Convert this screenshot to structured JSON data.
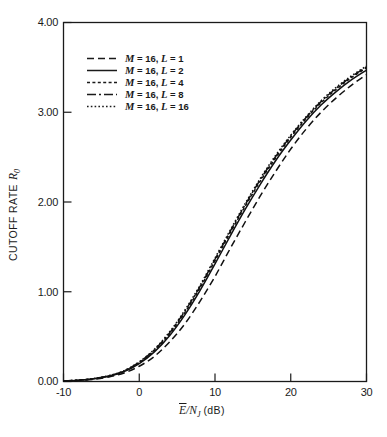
{
  "chart_data": {
    "type": "line",
    "title": "",
    "xlabel": "Ē/N_J (dB)",
    "xlabel_main": "E",
    "xlabel_rest": "/N",
    "xlabel_sub": "J",
    "xlabel_unit": "(dB)",
    "ylabel": "CUTOFF RATE R0",
    "ylabel_main": "CUTOFF RATE",
    "ylabel_sym": "R",
    "ylabel_sub": "0",
    "xlim": [
      -10,
      30
    ],
    "ylim": [
      0.0,
      4.0
    ],
    "grid": false,
    "legend_position": "upper-left-inside",
    "xticks": [
      -10,
      0,
      10,
      20,
      30
    ],
    "xtick_labels": [
      "-10",
      "0",
      "10",
      "20",
      "30"
    ],
    "yticks": [
      0.0,
      1.0,
      2.0,
      3.0,
      4.0
    ],
    "ytick_labels": [
      "0.00",
      "1.00",
      "2.00",
      "3.00",
      "4.00"
    ],
    "x": [
      -10,
      -8,
      -6,
      -4,
      -2,
      0,
      2,
      4,
      6,
      8,
      10,
      12,
      14,
      16,
      18,
      20,
      22,
      24,
      26,
      28,
      30
    ],
    "series": [
      {
        "name": "M = 16, L = 1",
        "M": 16,
        "L": 1,
        "dash": "7,4",
        "values": [
          0.005,
          0.012,
          0.025,
          0.05,
          0.095,
          0.17,
          0.28,
          0.44,
          0.64,
          0.89,
          1.17,
          1.48,
          1.78,
          2.07,
          2.34,
          2.59,
          2.81,
          3.0,
          3.16,
          3.3,
          3.42
        ]
      },
      {
        "name": "M = 16, L = 2",
        "M": 16,
        "L": 2,
        "dash": "none",
        "values": [
          0.006,
          0.014,
          0.03,
          0.058,
          0.11,
          0.2,
          0.33,
          0.51,
          0.74,
          1.01,
          1.31,
          1.62,
          1.92,
          2.2,
          2.46,
          2.69,
          2.9,
          3.08,
          3.23,
          3.36,
          3.47
        ]
      },
      {
        "name": "M = 16, L = 4",
        "M": 16,
        "L": 4,
        "dash": "3,2.4",
        "values": [
          0.006,
          0.015,
          0.031,
          0.061,
          0.115,
          0.21,
          0.345,
          0.53,
          0.765,
          1.04,
          1.345,
          1.655,
          1.955,
          2.235,
          2.49,
          2.72,
          2.925,
          3.105,
          3.255,
          3.385,
          3.495
        ]
      },
      {
        "name": "M = 16, L = 8",
        "M": 16,
        "L": 8,
        "dash": "9,3,2,3",
        "values": [
          0.0065,
          0.0155,
          0.032,
          0.063,
          0.118,
          0.215,
          0.353,
          0.542,
          0.78,
          1.055,
          1.362,
          1.672,
          1.972,
          2.252,
          2.505,
          2.735,
          2.938,
          3.118,
          3.268,
          3.395,
          3.505
        ]
      },
      {
        "name": "M = 16, L = 16",
        "M": 16,
        "L": 16,
        "dash": "1.6,2.2",
        "values": [
          0.007,
          0.016,
          0.033,
          0.065,
          0.121,
          0.22,
          0.36,
          0.552,
          0.792,
          1.068,
          1.375,
          1.685,
          1.985,
          2.265,
          2.518,
          2.745,
          2.948,
          3.128,
          3.278,
          3.405,
          3.515
        ]
      }
    ],
    "legend_entries": [
      {
        "prefix": "M",
        "eq1": " = 16, ",
        "sym": "L",
        "eq2": " = 1",
        "style": "dashed"
      },
      {
        "prefix": "M",
        "eq1": " = 16, ",
        "sym": "L",
        "eq2": " = 2",
        "style": "solid"
      },
      {
        "prefix": "M",
        "eq1": " = 16, ",
        "sym": "L",
        "eq2": " = 4",
        "style": "finedash"
      },
      {
        "prefix": "M",
        "eq1": " = 16, ",
        "sym": "L",
        "eq2": " = 8",
        "style": "dashdot"
      },
      {
        "prefix": "M",
        "eq1": " = 16, ",
        "sym": "L",
        "eq2": " = 16",
        "style": "dotted"
      }
    ],
    "colors": {
      "ink": "#1a1a1a",
      "background": "#ffffff"
    }
  }
}
